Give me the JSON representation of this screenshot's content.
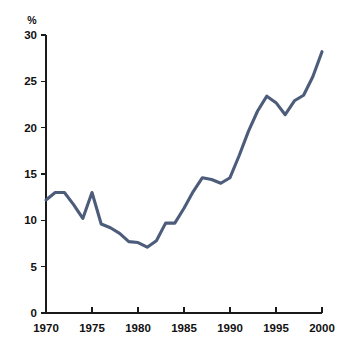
{
  "chart_data": {
    "type": "line",
    "title": "",
    "subtitle": "",
    "xlabel": "",
    "ylabel": "",
    "unit_label": "%",
    "xlim": [
      1970,
      2000
    ],
    "ylim": [
      0,
      30
    ],
    "xticks": [
      1970,
      1975,
      1980,
      1985,
      1990,
      1995,
      2000
    ],
    "xtick_labels": [
      "1970",
      "1975",
      "1980",
      "1985",
      "1990",
      "1995",
      "2000"
    ],
    "yticks": [
      0,
      5,
      10,
      15,
      20,
      25,
      30
    ],
    "ytick_labels": [
      "0",
      "5",
      "10",
      "15",
      "20",
      "25",
      "30"
    ],
    "grid": false,
    "legend": false,
    "legend_position": "none",
    "line_color": "#4c5c7a",
    "axis_color": "#1a1a1a",
    "background_color": "#ffffff",
    "series": [
      {
        "name": "Series 1",
        "color": "#4c5c7a",
        "x": [
          1970,
          1971,
          1972,
          1973,
          1974,
          1975,
          1976,
          1977,
          1978,
          1979,
          1980,
          1981,
          1982,
          1983,
          1984,
          1985,
          1986,
          1987,
          1988,
          1989,
          1990,
          1991,
          1992,
          1993,
          1994,
          1995,
          1996,
          1997,
          1998,
          1999,
          2000
        ],
        "values": [
          12.2,
          13.0,
          13.0,
          11.7,
          10.2,
          13.0,
          9.6,
          9.2,
          8.6,
          7.7,
          7.6,
          7.1,
          7.8,
          9.7,
          9.7,
          11.3,
          13.1,
          14.6,
          14.4,
          14.0,
          14.6,
          17.0,
          19.6,
          21.8,
          23.4,
          22.7,
          21.4,
          22.9,
          23.5,
          25.5,
          28.2
        ]
      }
    ]
  },
  "axes": {
    "y_unit": "%"
  }
}
